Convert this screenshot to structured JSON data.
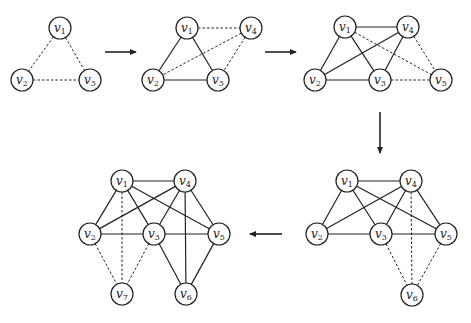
{
  "node_radius": 11,
  "graphs": [
    {
      "id": "step-1",
      "nodes": [
        {
          "label": "v",
          "sub": "1",
          "x": 60,
          "y": 28
        },
        {
          "label": "v",
          "sub": "2",
          "x": 22,
          "y": 80
        },
        {
          "label": "v",
          "sub": "3",
          "x": 90,
          "y": 80
        }
      ],
      "edges": [
        {
          "a": 0,
          "b": 1,
          "style": "dashed"
        },
        {
          "a": 0,
          "b": 2,
          "style": "dashed"
        },
        {
          "a": 1,
          "b": 2,
          "style": "dashed"
        }
      ]
    },
    {
      "id": "step-2",
      "nodes": [
        {
          "label": "v",
          "sub": "1",
          "x": 187,
          "y": 28
        },
        {
          "label": "v",
          "sub": "4",
          "x": 251,
          "y": 28
        },
        {
          "label": "v",
          "sub": "2",
          "x": 153,
          "y": 80
        },
        {
          "label": "v",
          "sub": "3",
          "x": 218,
          "y": 80
        }
      ],
      "edges": [
        {
          "a": 0,
          "b": 2,
          "style": "solid"
        },
        {
          "a": 0,
          "b": 3,
          "style": "solid"
        },
        {
          "a": 2,
          "b": 3,
          "style": "solid"
        },
        {
          "a": 0,
          "b": 1,
          "style": "dashed"
        },
        {
          "a": 1,
          "b": 2,
          "style": "dashed"
        },
        {
          "a": 1,
          "b": 3,
          "style": "dashed"
        }
      ]
    },
    {
      "id": "step-3",
      "nodes": [
        {
          "label": "v",
          "sub": "1",
          "x": 345,
          "y": 27
        },
        {
          "label": "v",
          "sub": "4",
          "x": 408,
          "y": 27
        },
        {
          "label": "v",
          "sub": "2",
          "x": 315,
          "y": 80
        },
        {
          "label": "v",
          "sub": "3",
          "x": 380,
          "y": 80
        },
        {
          "label": "v",
          "sub": "5",
          "x": 441,
          "y": 80
        }
      ],
      "edges": [
        {
          "a": 0,
          "b": 1,
          "style": "solid"
        },
        {
          "a": 0,
          "b": 2,
          "style": "solid"
        },
        {
          "a": 0,
          "b": 3,
          "style": "solid"
        },
        {
          "a": 2,
          "b": 3,
          "style": "solid"
        },
        {
          "a": 1,
          "b": 2,
          "style": "solid"
        },
        {
          "a": 1,
          "b": 3,
          "style": "solid"
        },
        {
          "a": 0,
          "b": 4,
          "style": "dashed"
        },
        {
          "a": 1,
          "b": 4,
          "style": "dashed"
        },
        {
          "a": 3,
          "b": 4,
          "style": "dashed"
        }
      ]
    },
    {
      "id": "step-4",
      "nodes": [
        {
          "label": "v",
          "sub": "1",
          "x": 347,
          "y": 181
        },
        {
          "label": "v",
          "sub": "4",
          "x": 411,
          "y": 181
        },
        {
          "label": "v",
          "sub": "2",
          "x": 317,
          "y": 234
        },
        {
          "label": "v",
          "sub": "3",
          "x": 381,
          "y": 234
        },
        {
          "label": "v",
          "sub": "5",
          "x": 446,
          "y": 234
        },
        {
          "label": "v",
          "sub": "6",
          "x": 412,
          "y": 295
        }
      ],
      "edges": [
        {
          "a": 0,
          "b": 1,
          "style": "solid"
        },
        {
          "a": 0,
          "b": 2,
          "style": "solid"
        },
        {
          "a": 0,
          "b": 3,
          "style": "solid"
        },
        {
          "a": 0,
          "b": 4,
          "style": "solid"
        },
        {
          "a": 1,
          "b": 2,
          "style": "solid"
        },
        {
          "a": 1,
          "b": 3,
          "style": "solid"
        },
        {
          "a": 1,
          "b": 4,
          "style": "solid"
        },
        {
          "a": 2,
          "b": 3,
          "style": "solid"
        },
        {
          "a": 3,
          "b": 4,
          "style": "solid"
        },
        {
          "a": 3,
          "b": 5,
          "style": "dashed"
        },
        {
          "a": 1,
          "b": 5,
          "style": "dashed"
        },
        {
          "a": 4,
          "b": 5,
          "style": "dashed"
        }
      ]
    },
    {
      "id": "step-5",
      "nodes": [
        {
          "label": "v",
          "sub": "1",
          "x": 122,
          "y": 181
        },
        {
          "label": "v",
          "sub": "4",
          "x": 185,
          "y": 181
        },
        {
          "label": "v",
          "sub": "2",
          "x": 90,
          "y": 234
        },
        {
          "label": "v",
          "sub": "3",
          "x": 154,
          "y": 234
        },
        {
          "label": "v",
          "sub": "5",
          "x": 219,
          "y": 234
        },
        {
          "label": "v",
          "sub": "7",
          "x": 122,
          "y": 294
        },
        {
          "label": "v",
          "sub": "6",
          "x": 186,
          "y": 294
        }
      ],
      "edges": [
        {
          "a": 0,
          "b": 1,
          "style": "solid"
        },
        {
          "a": 0,
          "b": 2,
          "style": "solid"
        },
        {
          "a": 0,
          "b": 3,
          "style": "solid"
        },
        {
          "a": 0,
          "b": 4,
          "style": "solid"
        },
        {
          "a": 1,
          "b": 2,
          "style": "solid"
        },
        {
          "a": 1,
          "b": 3,
          "style": "solid"
        },
        {
          "a": 1,
          "b": 4,
          "style": "solid"
        },
        {
          "a": 2,
          "b": 3,
          "style": "solid"
        },
        {
          "a": 3,
          "b": 4,
          "style": "solid"
        },
        {
          "a": 3,
          "b": 6,
          "style": "solid"
        },
        {
          "a": 1,
          "b": 6,
          "style": "solid"
        },
        {
          "a": 4,
          "b": 6,
          "style": "solid"
        },
        {
          "a": 2,
          "b": 5,
          "style": "dashed"
        },
        {
          "a": 0,
          "b": 5,
          "style": "dashed"
        },
        {
          "a": 3,
          "b": 5,
          "style": "dashed"
        }
      ]
    }
  ],
  "arrows": [
    {
      "from": "step-1",
      "to": "step-2",
      "x1": 105,
      "y1": 52,
      "x2": 136,
      "y2": 52
    },
    {
      "from": "step-2",
      "to": "step-3",
      "x1": 265,
      "y1": 52,
      "x2": 296,
      "y2": 52
    },
    {
      "from": "step-3",
      "to": "step-4",
      "x1": 380,
      "y1": 112,
      "x2": 380,
      "y2": 153
    },
    {
      "from": "step-4",
      "to": "step-5",
      "x1": 282,
      "y1": 234,
      "x2": 250,
      "y2": 234
    }
  ]
}
